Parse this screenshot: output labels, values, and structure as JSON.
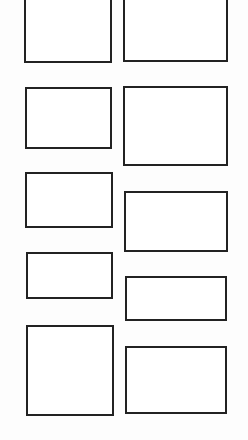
{
  "canvas": {
    "width": 248,
    "height": 440,
    "background": "#fdfdfd",
    "stroke_color": "#222222",
    "stroke_width": 2
  },
  "panels": [
    {
      "id": "left-1",
      "column": "left",
      "x": 24,
      "y": -4,
      "w": 88,
      "h": 67
    },
    {
      "id": "right-1",
      "column": "right",
      "x": 123,
      "y": -4,
      "w": 105,
      "h": 66
    },
    {
      "id": "left-2",
      "column": "left",
      "x": 25,
      "y": 87,
      "w": 87,
      "h": 62
    },
    {
      "id": "right-2",
      "column": "right",
      "x": 123,
      "y": 86,
      "w": 105,
      "h": 80
    },
    {
      "id": "left-3",
      "column": "left",
      "x": 25,
      "y": 172,
      "w": 88,
      "h": 56
    },
    {
      "id": "right-3",
      "column": "right",
      "x": 124,
      "y": 191,
      "w": 104,
      "h": 61
    },
    {
      "id": "left-4",
      "column": "left",
      "x": 26,
      "y": 252,
      "w": 87,
      "h": 47
    },
    {
      "id": "right-4",
      "column": "right",
      "x": 125,
      "y": 276,
      "w": 102,
      "h": 45
    },
    {
      "id": "left-5",
      "column": "left",
      "x": 26,
      "y": 325,
      "w": 88,
      "h": 91
    },
    {
      "id": "right-5",
      "column": "right",
      "x": 125,
      "y": 346,
      "w": 102,
      "h": 68
    }
  ]
}
